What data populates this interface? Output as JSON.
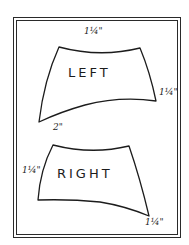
{
  "diagram": {
    "type": "pattern-template",
    "frame": {
      "style": "double-border",
      "color": "#2a2a2a"
    },
    "pieces": [
      {
        "name": "left-piece",
        "label": "LEFT",
        "dimensions": {
          "top": "1¼\"",
          "right": "1¼\"",
          "bottom_left": "2\""
        }
      },
      {
        "name": "right-piece",
        "label": "RIGHT",
        "dimensions": {
          "left": "1¼\"",
          "bottom_right": "1¼\""
        }
      }
    ],
    "colors": {
      "line": "#1c1c1c",
      "background": "#ffffff"
    }
  }
}
